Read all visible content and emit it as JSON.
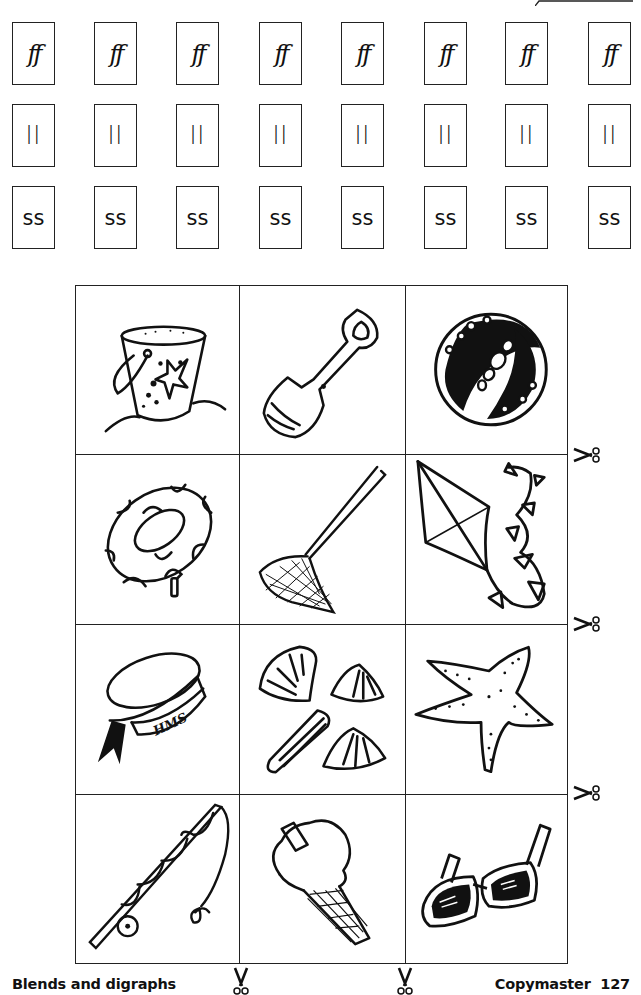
{
  "page": {
    "footer_title": "Blends and digraphs",
    "footer_page": "Copymaster  127"
  },
  "letter_cards": {
    "rows": [
      {
        "digraph": "ff",
        "cards": [
          "ff",
          "ff",
          "ff",
          "ff",
          "ff",
          "ff",
          "ff",
          "ff"
        ]
      },
      {
        "digraph": "ll",
        "cards": [
          "ll",
          "ll",
          "ll",
          "ll",
          "ll",
          "ll",
          "ll",
          "ll"
        ]
      },
      {
        "digraph": "ss",
        "cards": [
          "ss",
          "ss",
          "ss",
          "ss",
          "ss",
          "ss",
          "ss",
          "ss"
        ]
      }
    ]
  },
  "picture_cards": [
    [
      "bucket",
      "spade",
      "ball"
    ],
    [
      "rubber-ring",
      "fishing-net",
      "kite"
    ],
    [
      "sailor-hat",
      "shells",
      "starfish"
    ],
    [
      "fishing-rod",
      "ice-cream",
      "sunglasses"
    ]
  ],
  "hat_label": "HMS",
  "icons": {
    "cut_line": "scissors-icon"
  },
  "colors": {
    "ink": "#111111",
    "paper": "#ffffff"
  }
}
